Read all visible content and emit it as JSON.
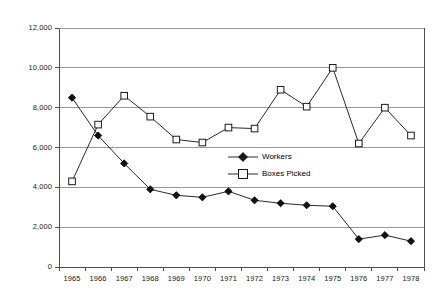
{
  "chart_data": {
    "type": "line",
    "title": "",
    "subtitle": "",
    "xlabel": "",
    "ylabel": "",
    "categories": [
      "1965",
      "1966",
      "1967",
      "1968",
      "1969",
      "1970",
      "1971",
      "1972",
      "1973",
      "1974",
      "1975",
      "1976",
      "1977",
      "1978"
    ],
    "ylim": [
      0,
      12000
    ],
    "ytick_values": [
      0,
      2000,
      4000,
      6000,
      8000,
      10000,
      12000
    ],
    "ytick_labels": [
      "0",
      "2,000",
      "4,000",
      "6,000",
      "8,000",
      "10,000",
      "12,000"
    ],
    "grid": "horizontal",
    "legend_position": "inside-center-right",
    "series": [
      {
        "name": "Workers",
        "marker": "filled-diamond",
        "color": "#000000",
        "values": [
          8500,
          6600,
          5200,
          3900,
          3600,
          3500,
          3800,
          3350,
          3200,
          3100,
          3050,
          1400,
          1600,
          1300
        ]
      },
      {
        "name": "Boxes Picked",
        "marker": "open-square",
        "color": "#000000",
        "values": [
          4300,
          7150,
          8600,
          7550,
          6400,
          6250,
          7000,
          6950,
          8900,
          8050,
          10000,
          6200,
          8000,
          6600
        ]
      }
    ]
  },
  "legend": {
    "items": [
      {
        "label": "Workers",
        "marker": "filled-diamond"
      },
      {
        "label": "Boxes Picked",
        "marker": "open-square"
      }
    ]
  },
  "axes": {
    "y_labels": [
      "12,000",
      "10,000",
      "8,000",
      "6,000",
      "4,000",
      "2,000",
      "0"
    ],
    "x_labels": [
      "1965",
      "1966",
      "1967",
      "1968",
      "1969",
      "1970",
      "1971",
      "1972",
      "1973",
      "1974",
      "1975",
      "1976",
      "1977",
      "1978"
    ]
  },
  "colors": {
    "line": "#2a2a2a",
    "grid": "#999999",
    "axis": "#4d4d4d",
    "text": "#1a1a1a",
    "background": "#ffffff"
  }
}
